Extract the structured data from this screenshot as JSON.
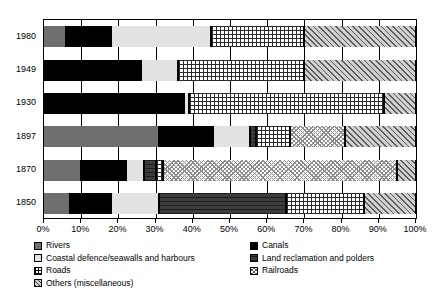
{
  "chart_data": {
    "type": "bar",
    "orientation": "horizontal",
    "stacked": true,
    "normalized": true,
    "title": "",
    "xlabel": "",
    "ylabel": "",
    "xlim": [
      0,
      100
    ],
    "grid": true,
    "legend_position": "bottom",
    "categories": [
      "1980",
      "1949",
      "1930",
      "1897",
      "1870",
      "1850"
    ],
    "x_tick_labels": [
      "0%",
      "10%",
      "20%",
      "30%",
      "40%",
      "50%",
      "60%",
      "70%",
      "80%",
      "90%",
      "100%"
    ],
    "x_tick_values": [
      0,
      10,
      20,
      30,
      40,
      50,
      60,
      70,
      80,
      90,
      100
    ],
    "series": [
      {
        "name": "Rivers",
        "key": "rivers",
        "pattern": "solid-grey",
        "values": [
          6.0,
          0.0,
          0.0,
          31.0,
          10.0,
          7.0
        ]
      },
      {
        "name": "Canals",
        "key": "canals",
        "pattern": "solid-black",
        "values": [
          12.0,
          26.0,
          37.5,
          14.5,
          12.0,
          11.0
        ]
      },
      {
        "name": "Coastal defence/seawalls and harbours",
        "key": "coastal",
        "pattern": "solid-light-grey",
        "values": [
          27.0,
          10.0,
          1.5,
          10.0,
          5.0,
          13.0
        ]
      },
      {
        "name": "Land reclamation and polders",
        "key": "land",
        "pattern": "dark-horizontal",
        "values": [
          0.0,
          0.0,
          0.0,
          1.5,
          3.0,
          34.0
        ]
      },
      {
        "name": "Roads",
        "key": "roads",
        "pattern": "crosshatch",
        "values": [
          25.0,
          34.0,
          52.5,
          9.0,
          2.0,
          21.0
        ]
      },
      {
        "name": "Railroads",
        "key": "rail",
        "pattern": "fine-diamond",
        "values": [
          0.0,
          0.0,
          0.0,
          15.0,
          63.0,
          0.0
        ]
      },
      {
        "name": "Others (miscellaneous)",
        "key": "others",
        "pattern": "diagonal-hatch",
        "values": [
          30.0,
          30.0,
          8.5,
          19.0,
          5.0,
          14.0
        ]
      }
    ]
  },
  "legend": {
    "left": [
      {
        "label": "Rivers",
        "key": "rivers"
      },
      {
        "label": "Coastal defence/seawalls and harbours",
        "key": "coastal"
      },
      {
        "label": "Roads",
        "key": "roads"
      },
      {
        "label": "Others (miscellaneous)",
        "key": "others"
      }
    ],
    "right": [
      {
        "label": "Canals",
        "key": "canals"
      },
      {
        "label": "Land reclamation and polders",
        "key": "land"
      },
      {
        "label": "Railroads",
        "key": "rail"
      }
    ]
  },
  "colors": {
    "rivers": "#6f6f6f",
    "canals": "#000000",
    "coastal": "#e2e2e2",
    "land": "#3d3d3d",
    "roads": "#ffffff",
    "rail": "#ffffff",
    "others": "#d0d0d0",
    "axis": "#000000",
    "background": "#ffffff"
  }
}
